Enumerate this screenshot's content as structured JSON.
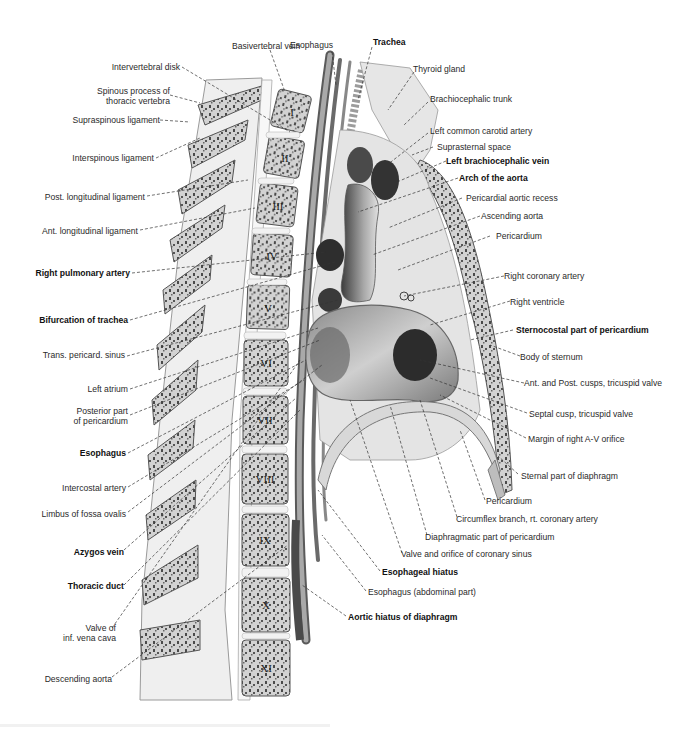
{
  "figure": {
    "vertebra_numerals": [
      "I",
      "II",
      "III",
      "IV",
      "V",
      "VI",
      "VII",
      "VIII",
      "IX",
      "X",
      "XI",
      "XII"
    ]
  },
  "labels": {
    "top": [
      {
        "id": "basivertebral-vein",
        "text": "Basivertebral vein",
        "bold": false
      },
      {
        "id": "esophagus-top",
        "text": "Esophagus",
        "bold": false
      },
      {
        "id": "trachea",
        "text": "Trachea",
        "bold": true
      }
    ],
    "left": [
      {
        "id": "intervertebral-disk",
        "text": "Intervertebral disk",
        "bold": false
      },
      {
        "id": "spinous-process",
        "text": "Spinous process of\nthoracic vertebra",
        "bold": false
      },
      {
        "id": "supraspinous-ligament",
        "text": "Supraspinous ligament",
        "bold": false
      },
      {
        "id": "interspinous-ligament",
        "text": "Interspinous ligament",
        "bold": false
      },
      {
        "id": "post-longitudinal-ligament",
        "text": "Post. longitudinal ligament",
        "bold": false
      },
      {
        "id": "ant-longitudinal-ligament",
        "text": "Ant. longitudinal ligament",
        "bold": false
      },
      {
        "id": "right-pulmonary-artery",
        "text": "Right pulmonary artery",
        "bold": true
      },
      {
        "id": "bifurcation-of-trachea",
        "text": "Bifurcation of trachea",
        "bold": true
      },
      {
        "id": "trans-pericard-sinus",
        "text": "Trans. pericard. sinus",
        "bold": false
      },
      {
        "id": "left-atrium",
        "text": "Left atrium",
        "bold": false
      },
      {
        "id": "posterior-part-pericardium",
        "text": "Posterior part\nof pericardium",
        "bold": false
      },
      {
        "id": "esophagus-left",
        "text": "Esophagus",
        "bold": true
      },
      {
        "id": "intercostal-artery",
        "text": "Intercostal artery",
        "bold": false
      },
      {
        "id": "limbus-fossa-ovalis",
        "text": "Limbus of fossa ovalis",
        "bold": false
      },
      {
        "id": "azygos-vein",
        "text": "Azygos vein",
        "bold": true
      },
      {
        "id": "thoracic-duct",
        "text": "Thoracic duct",
        "bold": true
      },
      {
        "id": "valve-inf-vena-cava",
        "text": "Valve of\ninf. vena cava",
        "bold": false
      },
      {
        "id": "descending-aorta",
        "text": "Descending aorta",
        "bold": false
      }
    ],
    "right": [
      {
        "id": "thyroid-gland",
        "text": "Thyroid gland",
        "bold": false
      },
      {
        "id": "brachiocephalic-trunk",
        "text": "Brachiocephalic trunk",
        "bold": false
      },
      {
        "id": "left-common-carotid-artery",
        "text": "Left common carotid artery",
        "bold": false
      },
      {
        "id": "suprasternal-space",
        "text": "Suprasternal space",
        "bold": false
      },
      {
        "id": "left-brachiocephalic-vein",
        "text": "Left brachiocephalic vein",
        "bold": true
      },
      {
        "id": "arch-of-aorta",
        "text": "Arch of the aorta",
        "bold": true
      },
      {
        "id": "pericardial-aortic-recess",
        "text": "Pericardial aortic recess",
        "bold": false
      },
      {
        "id": "ascending-aorta",
        "text": "Ascending aorta",
        "bold": false
      },
      {
        "id": "pericardium-upper",
        "text": "Pericardium",
        "bold": false
      },
      {
        "id": "right-coronary-artery",
        "text": "Right coronary artery",
        "bold": false
      },
      {
        "id": "right-ventricle",
        "text": "Right ventricle",
        "bold": false
      },
      {
        "id": "sternocostal-part-pericardium",
        "text": "Sternocostal part of pericardium",
        "bold": true
      },
      {
        "id": "body-of-sternum",
        "text": "Body of sternum",
        "bold": false
      },
      {
        "id": "ant-post-cusps-tricuspid",
        "text": "Ant. and Post. cusps, tricuspid valve",
        "bold": false
      },
      {
        "id": "septal-cusp-tricuspid",
        "text": "Septal cusp, tricuspid valve",
        "bold": false
      },
      {
        "id": "margin-right-av-orifice",
        "text": "Margin of right A-V orifice",
        "bold": false
      },
      {
        "id": "sternal-part-diaphragm",
        "text": "Sternal part of diaphragm",
        "bold": false
      }
    ],
    "bottom": [
      {
        "id": "pericardium-lower",
        "text": "Pericardium",
        "bold": false
      },
      {
        "id": "circumflex-branch",
        "text": "Circumflex branch, rt. coronary artery",
        "bold": false
      },
      {
        "id": "diaphragmatic-part-pericardium",
        "text": "Diaphragmatic part of pericardium",
        "bold": false
      },
      {
        "id": "valve-orifice-coronary-sinus",
        "text": "Valve and orifice of coronary sinus",
        "bold": false
      },
      {
        "id": "esophageal-hiatus",
        "text": "Esophageal hiatus",
        "bold": true
      },
      {
        "id": "esophagus-abdominal",
        "text": "Esophagus (abdominal part)",
        "bold": false
      },
      {
        "id": "aortic-hiatus-diaphragm",
        "text": "Aortic hiatus of diaphragm",
        "bold": true
      }
    ]
  },
  "colors": {
    "background": "#ffffff",
    "label_text": "#2a2a2a",
    "leader_line": "#333333",
    "bone_fill": "#c9c9c9",
    "bone_dark": "#4a4a4a",
    "soft_tissue": "#dcdcdc",
    "cavity_dark": "#3a3a3a"
  }
}
